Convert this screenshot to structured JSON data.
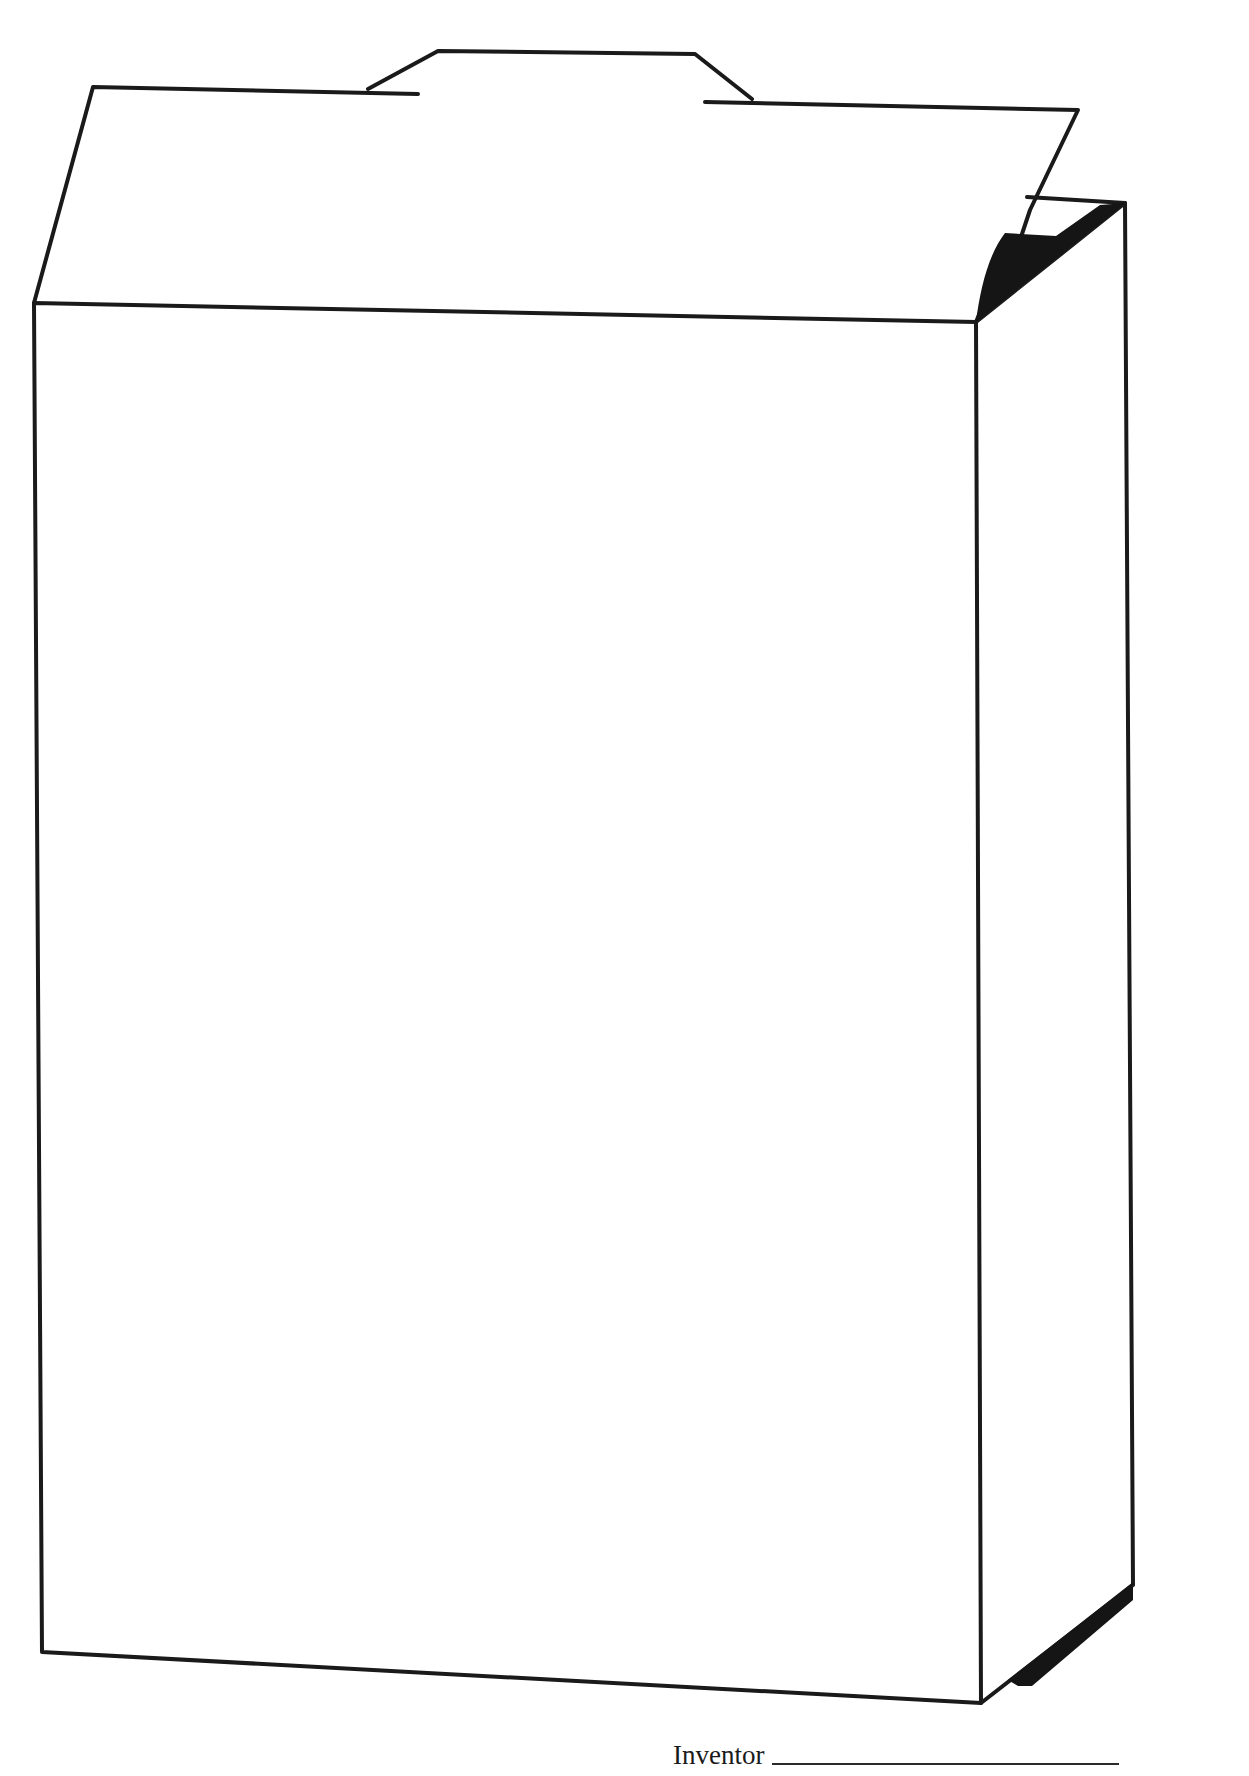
{
  "page": {
    "title_cropped": "",
    "footer": {
      "inventor_label": "Inventor",
      "inventor_value": ""
    }
  },
  "colors": {
    "ink": "#1a1a1a",
    "paper": "#ffffff"
  },
  "drawing": {
    "subject": "open-top box / carton outline",
    "parts": [
      "front-face",
      "right-side-face",
      "top-flap",
      "tab",
      "inner-shadow-top",
      "shadow-bottom"
    ]
  }
}
